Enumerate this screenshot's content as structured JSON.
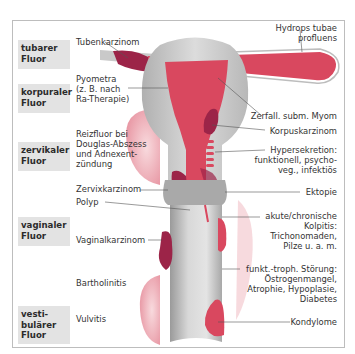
{
  "categories": [
    {
      "id": "tubar",
      "line1": "tubarer",
      "line2": "Fluor"
    },
    {
      "id": "korpural",
      "line1": "korpuraler",
      "line2": "Fluor"
    },
    {
      "id": "zervikal",
      "line1": "zervikaler",
      "line2": "Fluor"
    },
    {
      "id": "vaginal",
      "line1": "vaginaler",
      "line2": "Fluor"
    },
    {
      "id": "vestibulaer",
      "line1": "vesti-",
      "line2": "bulärer",
      "line3": "Fluor"
    }
  ],
  "left_labels": [
    {
      "lines": [
        "Tubenkarzinom"
      ]
    },
    {
      "lines": [
        "Pyometra",
        "(z. B. nach",
        "Ra-Therapie)"
      ]
    },
    {
      "lines": [
        "Reizfluor bei",
        "Douglas-Abszess",
        "und Adnexent-",
        "zündung"
      ]
    },
    {
      "lines": [
        "Zervixkarzinom"
      ]
    },
    {
      "lines": [
        "Polyp"
      ]
    },
    {
      "lines": [
        "Vaginalkarzinom"
      ]
    },
    {
      "lines": [
        "Bartholinitis"
      ]
    },
    {
      "lines": [
        "Vulvitis"
      ]
    }
  ],
  "right_labels": [
    {
      "lines": [
        "Hydrops tubae",
        "profluens"
      ]
    },
    {
      "lines": [
        "Zerfall. subm. Myom"
      ]
    },
    {
      "lines": [
        "Korpuskarzinom"
      ]
    },
    {
      "lines": [
        "Hypersekretion:",
        "funktionell, psycho-",
        "veg., infektiös"
      ]
    },
    {
      "lines": [
        "Ektopie"
      ]
    },
    {
      "lines": [
        "akute/chronische",
        "Kolpitis:",
        "Trichonomaden,",
        "Pilze u. a. m."
      ]
    },
    {
      "lines": [
        "funkt.-troph. Störung:",
        "Östrogenmangel,",
        "Atrophie, Hypoplasie,",
        "Diabetes"
      ]
    },
    {
      "lines": [
        "Kondylome"
      ]
    }
  ],
  "colors": {
    "tissue_red": "#d9485f",
    "dark_lesion": "#9c2448",
    "light_pink": "#f0b9c0",
    "organ_gray": "#c8c8c8",
    "label_box": "#e3e3e3",
    "frame": "#bdbdbd"
  }
}
